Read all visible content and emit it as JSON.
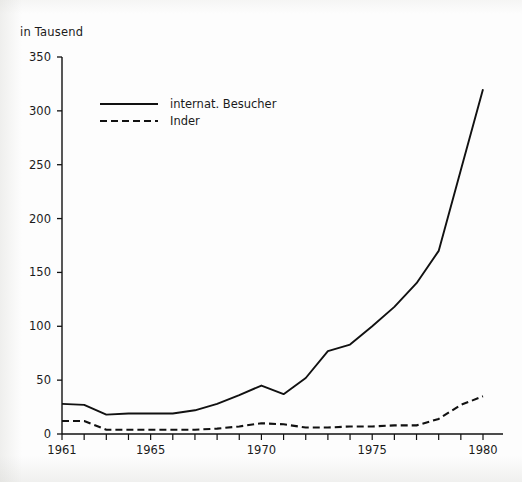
{
  "chart_data": {
    "type": "line",
    "title": "",
    "unit_label": "in Tausend",
    "xlabel": "",
    "ylabel": "in Tausend",
    "grid": false,
    "legend_position": "top-left-inside",
    "xlim": [
      1961,
      1980
    ],
    "ylim": [
      0,
      350
    ],
    "ytick_labels": [
      "0",
      "50",
      "100",
      "150",
      "200",
      "250",
      "300",
      "350"
    ],
    "yticks": [
      0,
      50,
      100,
      150,
      200,
      250,
      300,
      350
    ],
    "xtick_labels": [
      "1961",
      "1965",
      "1970",
      "1975",
      "1980"
    ],
    "xticks": [
      1961,
      1965,
      1970,
      1975,
      1980
    ],
    "x": [
      1961,
      1962,
      1963,
      1964,
      1965,
      1966,
      1967,
      1968,
      1969,
      1970,
      1971,
      1972,
      1973,
      1974,
      1975,
      1976,
      1977,
      1978,
      1979,
      1980
    ],
    "series": [
      {
        "name": "internat. Besucher",
        "style": "solid",
        "color": "#111111",
        "values": [
          28,
          27,
          18,
          19,
          19,
          19,
          22,
          28,
          36,
          45,
          37,
          52,
          77,
          83,
          100,
          118,
          140,
          170,
          245,
          320
        ]
      },
      {
        "name": "Inder",
        "style": "dashed",
        "color": "#111111",
        "values": [
          12,
          12,
          4,
          4,
          4,
          4,
          4,
          5,
          7,
          10,
          9,
          6,
          6,
          7,
          7,
          8,
          8,
          14,
          27,
          35
        ]
      }
    ]
  },
  "legend": {
    "items": [
      {
        "label": "internat. Besucher",
        "style": "solid"
      },
      {
        "label": "Inder",
        "style": "dashed"
      }
    ]
  }
}
